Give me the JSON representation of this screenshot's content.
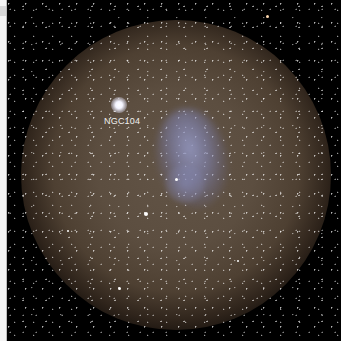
{
  "image": {
    "subject": "Small Magellanic Cloud star field",
    "annotations": [
      {
        "label": "NGC104",
        "x": 97,
        "y": 116
      }
    ]
  },
  "colors": {
    "background": "#000000",
    "sky_glow": "#625446",
    "cloud": "#969bc8",
    "label_text": "#f0f0f0",
    "left_strip": "#f4f4f4"
  },
  "bright_stars": [
    {
      "name": "NGC104-cluster",
      "x": 118,
      "y": 104,
      "size": 14
    },
    {
      "name": "star-lower-left",
      "x": 146,
      "y": 214,
      "size": 5
    },
    {
      "name": "star-top-right",
      "x": 268,
      "y": 17,
      "size": 4
    },
    {
      "name": "star-bottom",
      "x": 119,
      "y": 288,
      "size": 4
    }
  ]
}
